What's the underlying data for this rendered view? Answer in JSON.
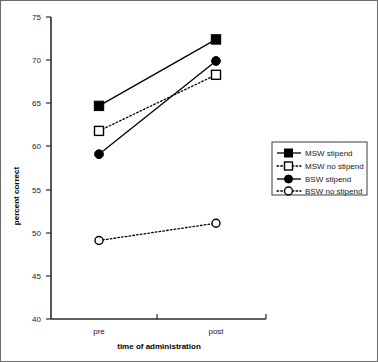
{
  "chart_data": {
    "type": "line",
    "title": "",
    "xlabel": "time of administration",
    "ylabel": "percent correct",
    "categories": [
      "pre",
      "post"
    ],
    "x": [
      0,
      1
    ],
    "ylim": [
      40,
      75
    ],
    "yticks": [
      40,
      45,
      50,
      55,
      60,
      65,
      70,
      75
    ],
    "ytick_labels": [
      "40",
      "45",
      "50",
      "55",
      "60",
      "65",
      "70",
      "75"
    ],
    "grid": false,
    "legend_position": "right",
    "series": [
      {
        "name": "MSW stipend",
        "values": [
          64.7,
          72.4
        ],
        "marker": "filled-square",
        "linestyle": "solid",
        "color": "#000000"
      },
      {
        "name": "MSW no stipend",
        "values": [
          61.8,
          68.3
        ],
        "marker": "open-square",
        "linestyle": "dotted",
        "color": "#000000"
      },
      {
        "name": "BSW stipend",
        "values": [
          59.1,
          69.9
        ],
        "marker": "filled-circle",
        "linestyle": "solid",
        "color": "#000000"
      },
      {
        "name": "BSW no stipend",
        "values": [
          49.1,
          51.1
        ],
        "marker": "open-circle",
        "linestyle": "dotted",
        "color": "#000000"
      }
    ]
  },
  "axes": {
    "y_title": "percent correct",
    "x_title": "time of administration",
    "y_tick_labels": [
      "75",
      "70",
      "65",
      "60",
      "55",
      "50",
      "45",
      "40"
    ],
    "x_tick_labels": [
      "pre",
      "post"
    ]
  },
  "legend": {
    "entries": [
      {
        "label": "MSW stipend"
      },
      {
        "label": "MSW no stipend"
      },
      {
        "label": "BSW stipend"
      },
      {
        "label": "BSW no stipend"
      }
    ]
  },
  "style": {
    "line_color": "#000000",
    "axis_color": "#2b2b2b",
    "frame_color": "#6b6b6b",
    "background": "#ffffff"
  }
}
